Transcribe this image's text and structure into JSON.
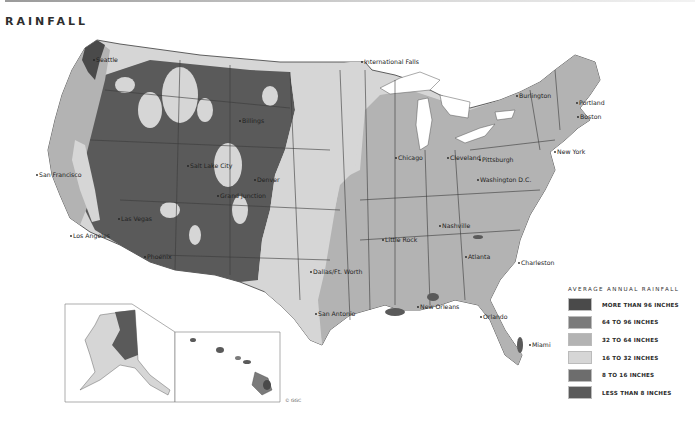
{
  "title": "RAINFALL",
  "copyright": "© GGC",
  "colors": {
    "more_than_96": "#4a4a4a",
    "64_to_96": "#7b7b7b",
    "32_to_64": "#b3b3b3",
    "16_to_32": "#d6d6d6",
    "8_to_16": "#6d6d6d",
    "less_than_8": "#5a5a5a",
    "border": "#3a3a3a",
    "water": "#ffffff"
  },
  "legend": {
    "title": "AVERAGE ANNUAL RAINFALL",
    "items": [
      {
        "label": "MORE THAN 96 INCHES",
        "color": "#4a4a4a"
      },
      {
        "label": "64 TO 96 INCHES",
        "color": "#7b7b7b"
      },
      {
        "label": "32 TO 64 INCHES",
        "color": "#b3b3b3"
      },
      {
        "label": "16 TO 32 INCHES",
        "color": "#d6d6d6"
      },
      {
        "label": "8 TO 16 INCHES",
        "color": "#6d6d6d"
      },
      {
        "label": "LESS THAN 8 INCHES",
        "color": "#5a5a5a"
      }
    ]
  },
  "cities": [
    {
      "name": "Seattle",
      "x": 94,
      "y": 60
    },
    {
      "name": "San Francisco",
      "x": 37,
      "y": 175
    },
    {
      "name": "Los Angeles",
      "x": 71,
      "y": 236
    },
    {
      "name": "Las Vegas",
      "x": 119,
      "y": 219
    },
    {
      "name": "Phoenix",
      "x": 145,
      "y": 257
    },
    {
      "name": "Salt Lake City",
      "x": 188,
      "y": 166
    },
    {
      "name": "Grand Junction",
      "x": 218,
      "y": 196
    },
    {
      "name": "Denver",
      "x": 255,
      "y": 180
    },
    {
      "name": "Billings",
      "x": 240,
      "y": 121
    },
    {
      "name": "International Falls",
      "x": 362,
      "y": 62
    },
    {
      "name": "Chicago",
      "x": 396,
      "y": 158
    },
    {
      "name": "Cleveland",
      "x": 448,
      "y": 158
    },
    {
      "name": "Pittsburgh",
      "x": 480,
      "y": 160
    },
    {
      "name": "Washington D.C.",
      "x": 478,
      "y": 180
    },
    {
      "name": "New York",
      "x": 555,
      "y": 152
    },
    {
      "name": "Burlington",
      "x": 517,
      "y": 96
    },
    {
      "name": "Portland",
      "x": 577,
      "y": 103
    },
    {
      "name": "Boston",
      "x": 578,
      "y": 117
    },
    {
      "name": "Nashville",
      "x": 440,
      "y": 226
    },
    {
      "name": "Little Rock",
      "x": 383,
      "y": 240
    },
    {
      "name": "Atlanta",
      "x": 466,
      "y": 257
    },
    {
      "name": "Charleston",
      "x": 519,
      "y": 263
    },
    {
      "name": "Dallas/Ft. Worth",
      "x": 311,
      "y": 272
    },
    {
      "name": "San Antonio",
      "x": 316,
      "y": 314
    },
    {
      "name": "New Orleans",
      "x": 418,
      "y": 307
    },
    {
      "name": "Orlando",
      "x": 481,
      "y": 317
    },
    {
      "name": "Miami",
      "x": 530,
      "y": 345
    }
  ]
}
